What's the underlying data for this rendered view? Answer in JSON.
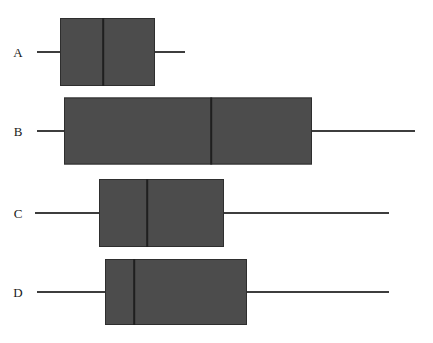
{
  "chart_data": {
    "type": "box",
    "title": "",
    "xlabel": "",
    "ylabel": "",
    "orientation": "horizontal",
    "grid": false,
    "legend": null,
    "axis_visible": false,
    "tick_labels": [],
    "xlim": [
      0,
      433
    ],
    "categories": [
      "A",
      "B",
      "C",
      "D"
    ],
    "units": "pixels",
    "colors": {
      "box_fill": "#4c4c4c",
      "box_edge": "#2e2e2e",
      "median": "#1f1f1f",
      "whisker": "#3d3d3d",
      "background": "#ffffff",
      "label": "#1a1a1a"
    },
    "boxes": [
      {
        "label": "A",
        "center_y": 52,
        "box_height": 68,
        "whisker_low": 37,
        "q1": 60,
        "median": 103,
        "q3": 155,
        "whisker_high": 185,
        "label_x": 18
      },
      {
        "label": "B",
        "center_y": 131,
        "box_height": 67,
        "whisker_low": 37,
        "q1": 64,
        "median": 211,
        "q3": 312,
        "whisker_high": 415,
        "label_x": 18
      },
      {
        "label": "C",
        "center_y": 213,
        "box_height": 68,
        "whisker_low": 35,
        "q1": 99,
        "median": 147,
        "q3": 224,
        "whisker_high": 389,
        "label_x": 18
      },
      {
        "label": "D",
        "center_y": 292,
        "box_height": 66,
        "whisker_low": 37,
        "q1": 105,
        "median": 134,
        "q3": 247,
        "whisker_high": 389,
        "label_x": 18
      }
    ]
  }
}
